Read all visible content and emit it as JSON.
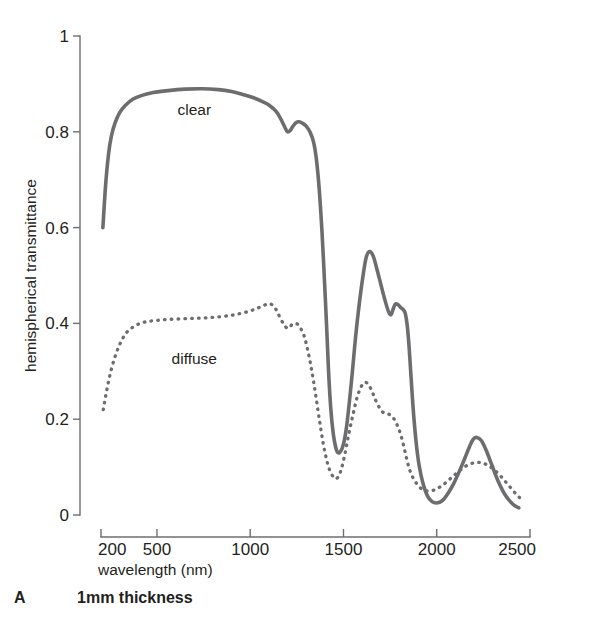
{
  "figure": {
    "panel_letter": "A",
    "panel_caption": "1mm thickness"
  },
  "chart_data": {
    "type": "line",
    "title": "",
    "subtitle": "",
    "xlabel": "wavelength (nm)",
    "ylabel": "hemispherical transmittance",
    "xlim": [
      150,
      2520
    ],
    "ylim": [
      0,
      1
    ],
    "grid": false,
    "legend": "inline-annotations",
    "xticks": [
      200,
      500,
      1000,
      1500,
      2000,
      2500
    ],
    "xticklabels": [
      "200",
      "500",
      "1000",
      "1500",
      "2000",
      "2500"
    ],
    "yticks": [
      0,
      0.2,
      0.4,
      0.6,
      0.8,
      1
    ],
    "yticklabels": [
      "0",
      "0.2",
      "0.4",
      "0.6",
      "0.8",
      "1"
    ],
    "annotations": [
      {
        "text": "clear",
        "x": 700,
        "y": 0.845
      },
      {
        "text": "diffuse",
        "x": 700,
        "y": 0.325
      }
    ],
    "series": [
      {
        "name": "clear",
        "style": "solid",
        "color": "#6d6d70",
        "x": [
          210,
          225,
          240,
          255,
          275,
          300,
          330,
          370,
          420,
          480,
          560,
          650,
          740,
          830,
          900,
          960,
          1010,
          1060,
          1100,
          1140,
          1165,
          1185,
          1200,
          1215,
          1230,
          1245,
          1262,
          1280,
          1300,
          1320,
          1340,
          1355,
          1370,
          1385,
          1398,
          1410,
          1420,
          1432,
          1445,
          1458,
          1470,
          1485,
          1500,
          1515,
          1530,
          1548,
          1565,
          1585,
          1605,
          1622,
          1640,
          1660,
          1680,
          1700,
          1720,
          1740,
          1755,
          1768,
          1780,
          1795,
          1810,
          1822,
          1832,
          1842,
          1852,
          1862,
          1875,
          1890,
          1905,
          1925,
          1950,
          1975,
          2000,
          2030,
          2060,
          2090,
          2120,
          2150,
          2175,
          2195,
          2215,
          2240,
          2265,
          2295,
          2330,
          2370,
          2410,
          2440
        ],
        "y": [
          0.6,
          0.69,
          0.752,
          0.79,
          0.818,
          0.84,
          0.855,
          0.868,
          0.876,
          0.882,
          0.886,
          0.889,
          0.89,
          0.888,
          0.884,
          0.878,
          0.872,
          0.864,
          0.856,
          0.842,
          0.826,
          0.81,
          0.8,
          0.803,
          0.812,
          0.819,
          0.821,
          0.818,
          0.812,
          0.8,
          0.778,
          0.742,
          0.68,
          0.59,
          0.49,
          0.39,
          0.3,
          0.222,
          0.17,
          0.142,
          0.13,
          0.133,
          0.148,
          0.18,
          0.23,
          0.3,
          0.372,
          0.442,
          0.5,
          0.538,
          0.55,
          0.54,
          0.512,
          0.482,
          0.452,
          0.426,
          0.418,
          0.432,
          0.441,
          0.438,
          0.432,
          0.428,
          0.42,
          0.395,
          0.35,
          0.29,
          0.215,
          0.15,
          0.105,
          0.068,
          0.04,
          0.028,
          0.025,
          0.03,
          0.045,
          0.065,
          0.09,
          0.118,
          0.142,
          0.158,
          0.162,
          0.155,
          0.135,
          0.105,
          0.07,
          0.04,
          0.022,
          0.015
        ]
      },
      {
        "name": "diffuse",
        "style": "dotted",
        "color": "#6d6d70",
        "x": [
          212,
          225,
          240,
          258,
          280,
          305,
          335,
          370,
          410,
          450,
          495,
          545,
          600,
          660,
          720,
          780,
          840,
          900,
          950,
          1000,
          1040,
          1075,
          1100,
          1120,
          1140,
          1160,
          1180,
          1198,
          1212,
          1225,
          1240,
          1255,
          1270,
          1288,
          1305,
          1322,
          1340,
          1358,
          1375,
          1392,
          1408,
          1422,
          1436,
          1450,
          1462,
          1475,
          1490,
          1508,
          1528,
          1550,
          1572,
          1595,
          1615,
          1635,
          1655,
          1672,
          1690,
          1710,
          1728,
          1745,
          1762,
          1778,
          1792,
          1805,
          1818,
          1830,
          1842,
          1855,
          1870,
          1888,
          1908,
          1930,
          1955,
          1985,
          2015,
          2050,
          2085,
          2120,
          2155,
          2190,
          2220,
          2250,
          2282,
          2315,
          2350,
          2385,
          2420,
          2445
        ],
        "y": [
          0.22,
          0.248,
          0.278,
          0.308,
          0.336,
          0.36,
          0.38,
          0.392,
          0.4,
          0.404,
          0.406,
          0.408,
          0.409,
          0.41,
          0.411,
          0.412,
          0.414,
          0.417,
          0.421,
          0.426,
          0.432,
          0.438,
          0.441,
          0.438,
          0.428,
          0.412,
          0.398,
          0.39,
          0.392,
          0.398,
          0.4,
          0.398,
          0.39,
          0.375,
          0.35,
          0.318,
          0.278,
          0.232,
          0.188,
          0.148,
          0.118,
          0.098,
          0.085,
          0.078,
          0.076,
          0.082,
          0.098,
          0.128,
          0.168,
          0.208,
          0.244,
          0.268,
          0.277,
          0.272,
          0.256,
          0.24,
          0.226,
          0.215,
          0.212,
          0.21,
          0.205,
          0.196,
          0.184,
          0.17,
          0.152,
          0.132,
          0.112,
          0.094,
          0.08,
          0.068,
          0.058,
          0.052,
          0.05,
          0.052,
          0.058,
          0.068,
          0.08,
          0.092,
          0.102,
          0.108,
          0.11,
          0.108,
          0.102,
          0.092,
          0.078,
          0.062,
          0.046,
          0.036
        ]
      }
    ]
  }
}
